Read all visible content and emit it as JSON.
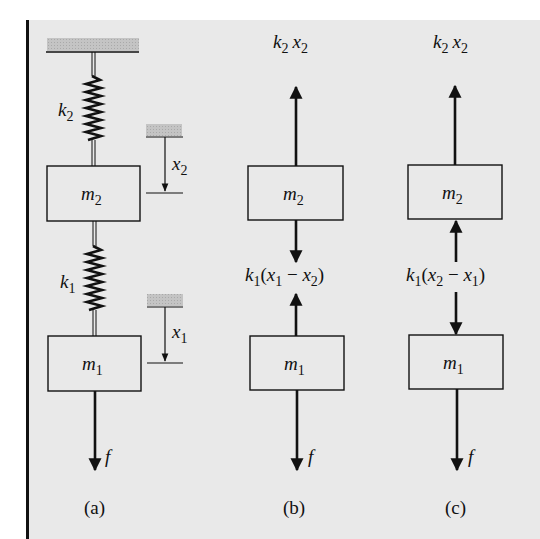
{
  "figure": {
    "background_color": "#e9e9e9",
    "ink_color": "#111111",
    "hatch_color": "#bdbdbd",
    "panels": [
      {
        "id": "a",
        "caption": "(a)",
        "springs": [
          {
            "label_sym": "k",
            "label_sub": "2"
          },
          {
            "label_sym": "k",
            "label_sub": "1"
          }
        ],
        "masses": [
          {
            "sym": "m",
            "sub": "2"
          },
          {
            "sym": "m",
            "sub": "1"
          }
        ],
        "displacements": [
          {
            "sym": "x",
            "sub": "2"
          },
          {
            "sym": "x",
            "sub": "1"
          }
        ],
        "force": {
          "sym": "f"
        }
      },
      {
        "id": "b",
        "caption": "(b)",
        "masses": [
          {
            "sym": "m",
            "sub": "2"
          },
          {
            "sym": "m",
            "sub": "1"
          }
        ],
        "top_force": {
          "k": "k",
          "k_sub": "2",
          "x": "x",
          "x_sub": "2"
        },
        "middle_force": {
          "k": "k",
          "k_sub": "1",
          "open": "(",
          "a": "x",
          "a_sub": "1",
          "op": " − ",
          "b": "x",
          "b_sub": "2",
          "close": ")"
        },
        "force": {
          "sym": "f"
        }
      },
      {
        "id": "c",
        "caption": "(c)",
        "masses": [
          {
            "sym": "m",
            "sub": "2"
          },
          {
            "sym": "m",
            "sub": "1"
          }
        ],
        "top_force": {
          "k": "k",
          "k_sub": "2",
          "x": "x",
          "x_sub": "2"
        },
        "middle_force": {
          "k": "k",
          "k_sub": "1",
          "open": "(",
          "a": "x",
          "a_sub": "2",
          "op": " − ",
          "b": "x",
          "b_sub": "1",
          "close": ")"
        },
        "force": {
          "sym": "f"
        }
      }
    ]
  }
}
